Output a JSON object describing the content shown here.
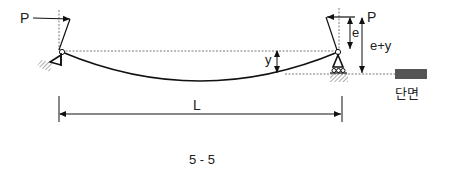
{
  "diagram": {
    "type": "structural-beam",
    "labels": {
      "load_left": "P",
      "load_right": "P",
      "eccentricity": "e",
      "eccentricity_plus_deflection": "e+y",
      "deflection": "y",
      "length": "L",
      "section": "단면",
      "figure_number": "5 - 5"
    },
    "colors": {
      "line": "#111111",
      "dashed": "#555555",
      "section_fill": "#555555",
      "hatch": "#777777"
    }
  }
}
